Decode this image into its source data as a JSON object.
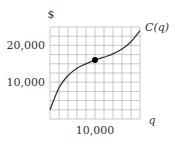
{
  "chart_data": {
    "type": "line",
    "title": "",
    "xlabel": "q",
    "ylabel": "$",
    "series": [
      {
        "name": "C(q)",
        "x": [
          0,
          2000,
          4000,
          6000,
          8000,
          10000,
          12000,
          14000,
          16000,
          18000,
          20000
        ],
        "values": [
          2500,
          8500,
          11800,
          13800,
          15000,
          16000,
          16800,
          17700,
          19000,
          21000,
          24000
        ]
      }
    ],
    "marked_point": {
      "x": 10000,
      "y": 16000
    },
    "x_ticks": [
      10000
    ],
    "x_tick_labels": [
      "10,000"
    ],
    "y_ticks": [
      10000,
      20000
    ],
    "y_tick_labels": [
      "10,000",
      "20,000"
    ],
    "xlim": [
      0,
      20000
    ],
    "ylim": [
      0,
      25000
    ],
    "grid": true,
    "grid_divisions": {
      "x": 10,
      "y": 10
    },
    "curve_label": "C(q)",
    "colors": {
      "curve": "#333333",
      "grid": "#b0b0b0",
      "point": "#000000"
    }
  }
}
